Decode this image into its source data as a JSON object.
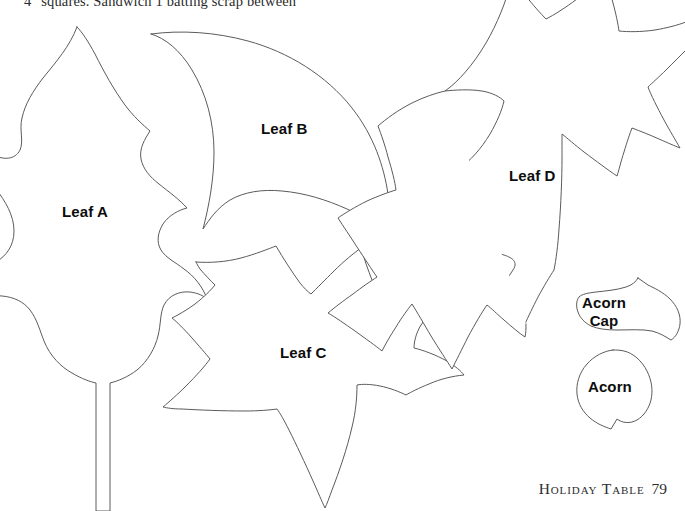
{
  "page": {
    "width": 685,
    "height": 511,
    "background_color": "#ffffff",
    "outline_color": "#5b5b5b",
    "label_color": "#0d0d0d",
    "top_instruction": "4\" squares. Sandwich 1 batting scrap between",
    "footer": {
      "running_head": "Holiday Table",
      "page_number": "79"
    }
  },
  "pieces": [
    {
      "id": "leaf-a",
      "label": "Leaf A",
      "label_x": 62,
      "label_y": 203,
      "description": "rounded-lobe oak leaf, clipped at left page edge"
    },
    {
      "id": "leaf-b",
      "label": "Leaf B",
      "label_x": 261,
      "label_y": 120,
      "description": "smooth teardrop leaf with point at lower right"
    },
    {
      "id": "leaf-c",
      "label": "Leaf C",
      "label_x": 280,
      "label_y": 344,
      "description": "five-point maple leaf, tip clipped at bottom edge"
    },
    {
      "id": "leaf-d",
      "label": "Leaf D",
      "label_x": 509,
      "label_y": 167,
      "description": "pointed-lobe oak leaf, tip clipped at top edge"
    },
    {
      "id": "acorn-cap",
      "label": "Acorn\nCap",
      "label_line_1": "Acorn",
      "label_line_2": "Cap",
      "label_x": 604,
      "label_y": 294,
      "description": "acorn cap with small stem nub on top"
    },
    {
      "id": "acorn",
      "label": "Acorn",
      "label_x": 588,
      "label_y": 378,
      "description": "teardrop acorn body with point at bottom"
    }
  ]
}
